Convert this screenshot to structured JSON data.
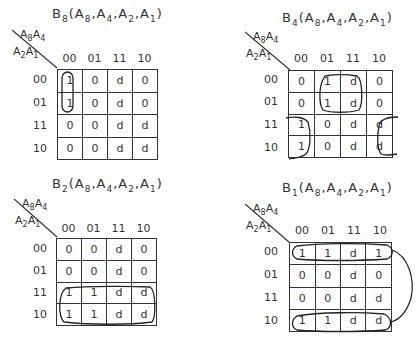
{
  "maps": [
    {
      "id": "b8",
      "output": "B",
      "output_sub": "8",
      "args": [
        [
          "A",
          "8"
        ],
        [
          "A",
          "4"
        ],
        [
          "A",
          "2"
        ],
        [
          "A",
          "1"
        ]
      ],
      "col_vars": [
        [
          "A",
          "8"
        ],
        [
          "A",
          "4"
        ]
      ],
      "row_vars": [
        [
          "A",
          "2"
        ],
        [
          "A",
          "1"
        ]
      ],
      "col_headers": [
        "00",
        "01",
        "11",
        "10"
      ],
      "row_headers": [
        "00",
        "01",
        "11",
        "10"
      ],
      "cells": [
        [
          "1",
          "0",
          "d",
          "0"
        ],
        [
          "1",
          "0",
          "d",
          "0"
        ],
        [
          "0",
          "0",
          "d",
          "d"
        ],
        [
          "0",
          "0",
          "d",
          "d"
        ]
      ],
      "loops_desc": [
        "column 00, rows 00-01"
      ]
    },
    {
      "id": "b4",
      "output": "B",
      "output_sub": "4",
      "args": [
        [
          "A",
          "8"
        ],
        [
          "A",
          "4"
        ],
        [
          "A",
          "2"
        ],
        [
          "A",
          "1"
        ]
      ],
      "col_vars": [
        [
          "A",
          "8"
        ],
        [
          "A",
          "4"
        ]
      ],
      "row_vars": [
        [
          "A",
          "2"
        ],
        [
          "A",
          "1"
        ]
      ],
      "col_headers": [
        "00",
        "01",
        "11",
        "10"
      ],
      "row_headers": [
        "00",
        "01",
        "11",
        "10"
      ],
      "cells": [
        [
          "0",
          "1",
          "d",
          "0"
        ],
        [
          "0",
          "1",
          "d",
          "0"
        ],
        [
          "1",
          "0",
          "d",
          "d"
        ],
        [
          "1",
          "0",
          "d",
          "d"
        ]
      ],
      "loops_desc": [
        "columns 01-11, rows 00-01",
        "columns 00 and 10 (wrap), rows 11-10"
      ]
    },
    {
      "id": "b2",
      "output": "B",
      "output_sub": "2",
      "args": [
        [
          "A",
          "8"
        ],
        [
          "A",
          "4"
        ],
        [
          "A",
          "2"
        ],
        [
          "A",
          "1"
        ]
      ],
      "col_vars": [
        [
          "A",
          "8"
        ],
        [
          "A",
          "4"
        ]
      ],
      "row_vars": [
        [
          "A",
          "2"
        ],
        [
          "A",
          "1"
        ]
      ],
      "col_headers": [
        "00",
        "01",
        "11",
        "10"
      ],
      "row_headers": [
        "00",
        "01",
        "11",
        "10"
      ],
      "cells": [
        [
          "0",
          "0",
          "d",
          "0"
        ],
        [
          "0",
          "0",
          "d",
          "0"
        ],
        [
          "1",
          "1",
          "d",
          "d"
        ],
        [
          "1",
          "1",
          "d",
          "d"
        ]
      ],
      "loops_desc": [
        "all columns, rows 11-10"
      ]
    },
    {
      "id": "b1",
      "output": "B",
      "output_sub": "1",
      "args": [
        [
          "A",
          "8"
        ],
        [
          "A",
          "4"
        ],
        [
          "A",
          "2"
        ],
        [
          "A",
          "1"
        ]
      ],
      "col_vars": [
        [
          "A",
          "8"
        ],
        [
          "A",
          "4"
        ]
      ],
      "row_vars": [
        [
          "A",
          "2"
        ],
        [
          "A",
          "1"
        ]
      ],
      "col_headers": [
        "00",
        "01",
        "11",
        "10"
      ],
      "row_headers": [
        "00",
        "01",
        "11",
        "10"
      ],
      "cells": [
        [
          "1",
          "1",
          "d",
          "1"
        ],
        [
          "0",
          "0",
          "d",
          "0"
        ],
        [
          "0",
          "0",
          "d",
          "d"
        ],
        [
          "1",
          "1",
          "d",
          "d"
        ]
      ],
      "loops_desc": [
        "row 00 all columns and row 10 all columns (wrap, connected)"
      ]
    }
  ]
}
